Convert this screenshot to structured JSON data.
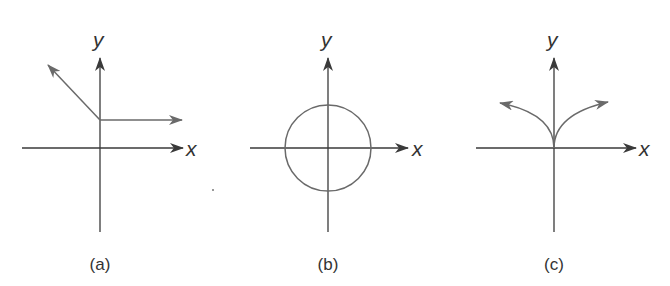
{
  "figure": {
    "panels": [
      {
        "id": "a",
        "caption": "(a)",
        "x_label": "x",
        "y_label": "y",
        "description": "Two rays from a point on the positive y-axis: one horizontal to the right, one diagonal up-left"
      },
      {
        "id": "b",
        "caption": "(b)",
        "x_label": "x",
        "y_label": "y",
        "description": "Circle centered at the origin"
      },
      {
        "id": "c",
        "caption": "(c)",
        "x_label": "x",
        "y_label": "y",
        "description": "Cusp at the origin with two curved branches opening upward to the left and right"
      }
    ],
    "colors": {
      "axis": "#3a3a3a",
      "curve": "#6a6a6a",
      "background": "#ffffff"
    }
  }
}
